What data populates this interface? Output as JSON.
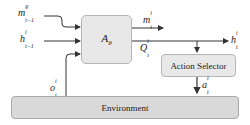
{
  "diagram": {
    "agent_block": {
      "label": "A",
      "subscript": "θ"
    },
    "action_selector": {
      "label": "Action Selector"
    },
    "environment": {
      "label": "Environment"
    },
    "inputs": [
      {
        "name": "m",
        "sup": "g",
        "sub": "t−1"
      },
      {
        "name": "h",
        "sup": "i",
        "sub": "t−1"
      }
    ],
    "outputs": {
      "message": {
        "name": "m",
        "sup": "i",
        "sub": "t"
      },
      "q_values": {
        "name": "Q",
        "sup": "i",
        "sub": "t"
      },
      "hidden": {
        "name": "h",
        "sup": "i",
        "sub": "t"
      }
    },
    "observation": {
      "name": "o",
      "sup": "i",
      "sub": "t"
    },
    "action": {
      "name": "a",
      "sup": "i",
      "sub": "t"
    },
    "colors": {
      "box_fill": "#e8e8e8",
      "env_fill": "#d9d9d9",
      "stroke": "#333333"
    }
  }
}
